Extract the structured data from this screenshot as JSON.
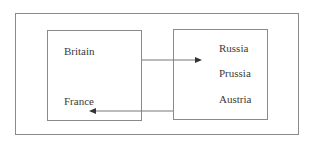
{
  "diagram": {
    "outer_frame": {
      "label": ""
    },
    "left_group": {
      "items": [
        {
          "label": "Britain"
        },
        {
          "label": "France"
        }
      ]
    },
    "right_group": {
      "items": [
        {
          "label": "Russia"
        },
        {
          "label": "Prussia"
        },
        {
          "label": "Austria"
        }
      ]
    },
    "edges": [
      {
        "from": "left_group",
        "to": "right_group",
        "direction": "right"
      },
      {
        "from": "right_group",
        "to": "left_group (France)",
        "direction": "left"
      }
    ],
    "colors": {
      "line": "#8a8a8a",
      "arrow": "#555555",
      "text": "#3a3a3a"
    }
  }
}
